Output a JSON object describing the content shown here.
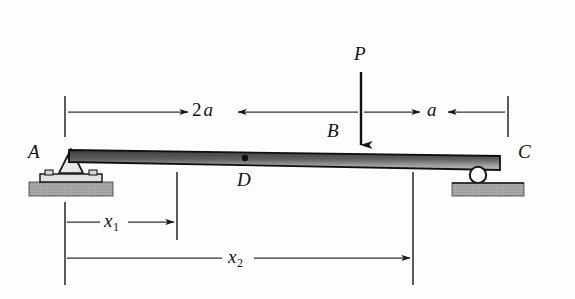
{
  "figure": {
    "type": "engineering-beam-diagram",
    "background_color": "#fdfdfd",
    "line_color": "#1a1a1a",
    "beam_fill_dark": "#4a4a4a",
    "beam_fill_light": "#b8b8b8",
    "ground_fill": "#a9a9a9"
  },
  "labels": {
    "support_a": "A",
    "point_b": "B",
    "support_c": "C",
    "point_d": "D",
    "load": "P",
    "dim_2a_number": "2",
    "dim_2a_symbol": "a",
    "dim_a": "a",
    "dim_x1_symbol": "x",
    "dim_x1_sub": "1",
    "dim_x2_symbol": "x",
    "dim_x2_sub": "2"
  },
  "dimensions": [
    {
      "name": "2a",
      "from": "A",
      "to": "B",
      "value": "2a"
    },
    {
      "name": "a",
      "from": "B",
      "to": "C",
      "value": "a"
    },
    {
      "name": "x1",
      "from": "A",
      "to": "section-1",
      "value": "x1"
    },
    {
      "name": "x2",
      "from": "A",
      "to": "section-2",
      "value": "x2"
    }
  ],
  "supports": [
    {
      "name": "pin-support",
      "at": "A"
    },
    {
      "name": "roller-support",
      "at": "C"
    }
  ],
  "loads": [
    {
      "name": "point-load",
      "symbol": "P",
      "at": "B",
      "direction": "down"
    }
  ]
}
